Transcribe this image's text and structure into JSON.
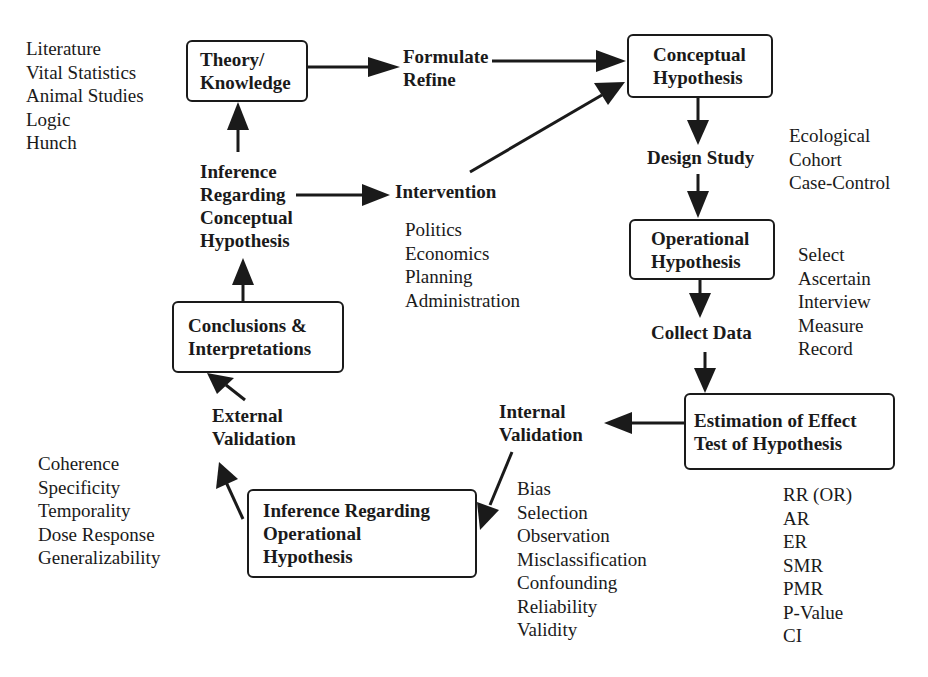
{
  "diagram": {
    "type": "flowchart",
    "theme": {
      "ink": "#1a1a1a",
      "background": "#ffffff"
    },
    "boxes": {
      "theory": {
        "lines": [
          "Theory/",
          "Knowledge"
        ]
      },
      "conceptual": {
        "lines": [
          "Conceptual",
          "Hypothesis"
        ]
      },
      "operational": {
        "lines": [
          "Operational",
          "Hypothesis"
        ]
      },
      "estimation": {
        "lines": [
          "Estimation of Effect",
          "Test of Hypothesis"
        ]
      },
      "inference_operational": {
        "lines": [
          "Inference Regarding",
          "Operational",
          "Hypothesis"
        ]
      },
      "conclusions": {
        "lines": [
          "Conclusions &",
          "Interpretations"
        ]
      }
    },
    "labels": {
      "formulate": {
        "lines": [
          "Formulate",
          "Refine"
        ]
      },
      "design_study": {
        "lines": [
          "Design Study"
        ]
      },
      "collect_data": {
        "lines": [
          "Collect Data"
        ]
      },
      "internal_validation": {
        "lines": [
          "Internal",
          "Validation"
        ]
      },
      "external_validation": {
        "lines": [
          "External",
          "Validation"
        ]
      },
      "inference_conceptual": {
        "lines": [
          "Inference",
          "Regarding",
          "Conceptual",
          "Hypothesis"
        ]
      },
      "intervention": {
        "lines": [
          "Intervention"
        ]
      }
    },
    "lists": {
      "sources": [
        "Literature",
        "Vital Statistics",
        "Animal Studies",
        "Logic",
        "Hunch"
      ],
      "study_designs": [
        "Ecological",
        "Cohort",
        "Case-Control"
      ],
      "data_steps": [
        "Select",
        "Ascertain",
        "Interview",
        "Measure",
        "Record"
      ],
      "measures": [
        "RR (OR)",
        "AR",
        "ER",
        "SMR",
        "PMR",
        "P-Value",
        "CI"
      ],
      "internal_criteria": [
        "Bias",
        "Selection",
        "Observation",
        "Misclassification",
        "Confounding",
        "Reliability",
        "Validity"
      ],
      "external_criteria": [
        "Coherence",
        "Specificity",
        "Temporality",
        "Dose Response",
        "Generalizability"
      ],
      "intervention_areas": [
        "Politics",
        "Economics",
        "Planning",
        "Administration"
      ]
    },
    "edges": [
      {
        "from": "Theory/Knowledge",
        "to": "Formulate Refine"
      },
      {
        "from": "Formulate Refine",
        "to": "Conceptual Hypothesis"
      },
      {
        "from": "Intervention",
        "to": "Conceptual Hypothesis"
      },
      {
        "from": "Conceptual Hypothesis",
        "to": "Design Study"
      },
      {
        "from": "Design Study",
        "to": "Operational Hypothesis"
      },
      {
        "from": "Operational Hypothesis",
        "to": "Collect Data"
      },
      {
        "from": "Collect Data",
        "to": "Estimation of Effect / Test of Hypothesis"
      },
      {
        "from": "Estimation of Effect / Test of Hypothesis",
        "to": "Internal Validation"
      },
      {
        "from": "Internal Validation",
        "to": "Inference Regarding Operational Hypothesis"
      },
      {
        "from": "Inference Regarding Operational Hypothesis",
        "to": "External Validation"
      },
      {
        "from": "External Validation",
        "to": "Conclusions & Interpretations"
      },
      {
        "from": "Conclusions & Interpretations",
        "to": "Inference Regarding Conceptual Hypothesis"
      },
      {
        "from": "Inference Regarding Conceptual Hypothesis",
        "to": "Theory/Knowledge"
      },
      {
        "from": "Inference Regarding Conceptual Hypothesis",
        "to": "Intervention"
      }
    ]
  }
}
